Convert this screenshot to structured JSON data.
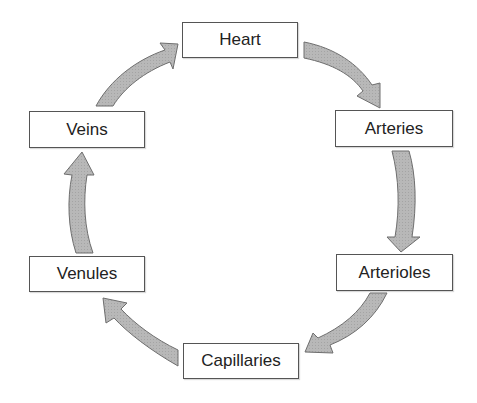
{
  "diagram": {
    "type": "cycle",
    "title": "",
    "nodes": [
      {
        "id": "heart",
        "label": "Heart"
      },
      {
        "id": "arteries",
        "label": "Arteries"
      },
      {
        "id": "arterioles",
        "label": "Arterioles"
      },
      {
        "id": "capillaries",
        "label": "Capillaries"
      },
      {
        "id": "venules",
        "label": "Venules"
      },
      {
        "id": "veins",
        "label": "Veins"
      }
    ],
    "edges": [
      {
        "from": "heart",
        "to": "arteries"
      },
      {
        "from": "arteries",
        "to": "arterioles"
      },
      {
        "from": "arterioles",
        "to": "capillaries"
      },
      {
        "from": "capillaries",
        "to": "venules"
      },
      {
        "from": "venules",
        "to": "veins"
      },
      {
        "from": "veins",
        "to": "heart"
      }
    ],
    "colors": {
      "arrow_fill": "#b4b4b4",
      "arrow_stroke": "#6e6e6e",
      "box_border": "#555555",
      "text": "#222222"
    }
  }
}
